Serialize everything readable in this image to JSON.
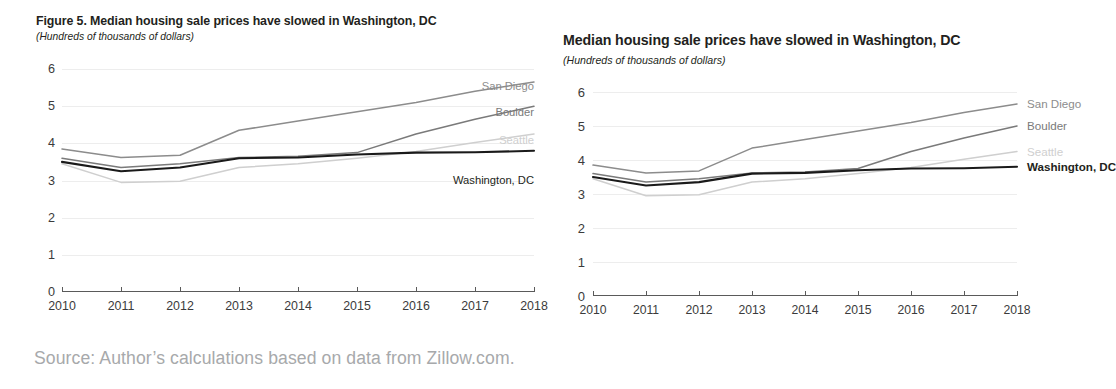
{
  "source_note": "Source: Author’s calculations based on data from Zillow.com.",
  "colors": {
    "washington": "#1a1a1a",
    "san_diego": "#8c8c8c",
    "boulder": "#7a7a7a",
    "seattle": "#cfcfcf",
    "gridline": "#ededed",
    "axis": "#5a5a5a",
    "tick_text": "#3b3b3b",
    "source_text": "#a7a9ab"
  },
  "panels": [
    {
      "id": "left",
      "title": "Figure 5. Median housing sale prices have slowed in Washington, DC",
      "subtitle": "(Hundreds of thousands of dollars)",
      "labels_inside_plot": true
    },
    {
      "id": "right",
      "title": "Median housing sale prices have slowed in Washington, DC",
      "subtitle": "(Hundreds of thousands of dollars)",
      "labels_inside_plot": false
    }
  ],
  "chart_data": {
    "type": "line",
    "title": "Median housing sale prices have slowed in Washington, DC",
    "subtitle": "(Hundreds of thousands of dollars)",
    "xlabel": "",
    "ylabel": "Hundreds of thousands of dollars",
    "grid": true,
    "legend_position": "end-of-line",
    "xlim": [
      2010,
      2018
    ],
    "ylim": [
      0,
      6
    ],
    "yticks": [
      0,
      1,
      2,
      3,
      4,
      5,
      6
    ],
    "categories": [
      2010,
      2011,
      2012,
      2013,
      2014,
      2015,
      2016,
      2017,
      2018
    ],
    "xtick_labels": [
      "2010",
      "2011",
      "2012",
      "2013",
      "2014",
      "2015",
      "2016",
      "2017",
      "2018"
    ],
    "series": [
      {
        "name": "San Diego",
        "color": "#8c8c8c",
        "bold": false,
        "values": [
          3.85,
          3.62,
          3.68,
          4.35,
          4.6,
          4.85,
          5.1,
          5.4,
          5.65
        ]
      },
      {
        "name": "Boulder",
        "color": "#7a7a7a",
        "bold": false,
        "values": [
          3.6,
          3.35,
          3.45,
          3.62,
          3.65,
          3.75,
          4.25,
          4.65,
          5.0
        ]
      },
      {
        "name": "Seattle",
        "color": "#cfcfcf",
        "bold": false,
        "values": [
          3.45,
          2.95,
          2.98,
          3.35,
          3.45,
          3.6,
          3.78,
          4.02,
          4.25
        ]
      },
      {
        "name": "Washington, DC",
        "color": "#1a1a1a",
        "bold": true,
        "values": [
          3.5,
          3.25,
          3.35,
          3.6,
          3.62,
          3.7,
          3.75,
          3.76,
          3.8
        ]
      }
    ]
  }
}
